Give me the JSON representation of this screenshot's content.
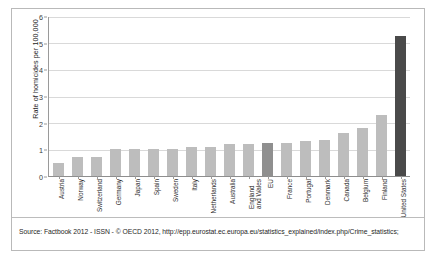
{
  "figure": {
    "source_note": "Source: Factbook 2012 - ISSN - © OECD 2012, http://epp.eurostat.ec.europa.eu/statistics_explained/index.php/Crime_statistics;"
  },
  "chart_data": {
    "type": "bar",
    "title": "",
    "xlabel": "",
    "ylabel": "Rate of homicides per 100,000",
    "ylim": [
      0,
      6
    ],
    "yticks": [
      0,
      1,
      2,
      3,
      4,
      5,
      6
    ],
    "grid": true,
    "legend": "none",
    "bar_color": "#bdbdbd",
    "highlight_color": "#8f8f8f",
    "accent_color": "#4a4a4a",
    "categories": [
      "Austria",
      "Norway",
      "Switzerland",
      "Germany",
      "Japan",
      "Spain",
      "Sweden",
      "Italy",
      "Netherlands",
      "Australia",
      "England\nand Wales",
      "EU",
      "France",
      "Portugal",
      "Denmark",
      "Canada",
      "Belgium",
      "Finland",
      "United States"
    ],
    "values": [
      0.5,
      0.7,
      0.7,
      1.0,
      1.0,
      1.0,
      1.0,
      1.1,
      1.1,
      1.2,
      1.2,
      1.25,
      1.25,
      1.3,
      1.35,
      1.6,
      1.8,
      2.3,
      5.25
    ],
    "emphasis": [
      "normal",
      "normal",
      "normal",
      "normal",
      "normal",
      "normal",
      "normal",
      "normal",
      "normal",
      "normal",
      "normal",
      "highlight",
      "normal",
      "normal",
      "normal",
      "normal",
      "normal",
      "normal",
      "accent"
    ]
  }
}
